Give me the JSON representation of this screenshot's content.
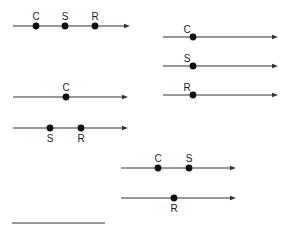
{
  "diagram": {
    "type": "number-line-arrangements",
    "colors": {
      "line": "#333333",
      "dot": "#111111",
      "text": "#1a1a1a",
      "background": "#ffffff"
    },
    "lines": [
      {
        "id": "line-1",
        "x1": 13,
        "x2": 130,
        "y": 26,
        "arrow": true,
        "points": [
          {
            "label": "C",
            "x": 36,
            "label_pos": "above"
          },
          {
            "label": "S",
            "x": 65,
            "label_pos": "above"
          },
          {
            "label": "R",
            "x": 95,
            "label_pos": "above"
          }
        ]
      },
      {
        "id": "line-2",
        "x1": 163,
        "x2": 278,
        "y": 37,
        "arrow": true,
        "points": [
          {
            "label": "C",
            "x": 193,
            "label_pos": "above-left"
          }
        ]
      },
      {
        "id": "line-3",
        "x1": 163,
        "x2": 278,
        "y": 66,
        "arrow": true,
        "points": [
          {
            "label": "S",
            "x": 193,
            "label_pos": "above-left"
          }
        ]
      },
      {
        "id": "line-4",
        "x1": 163,
        "x2": 278,
        "y": 95,
        "arrow": true,
        "points": [
          {
            "label": "R",
            "x": 193,
            "label_pos": "above-left"
          }
        ]
      },
      {
        "id": "line-5",
        "x1": 13,
        "x2": 128,
        "y": 97,
        "arrow": true,
        "points": [
          {
            "label": "C",
            "x": 66,
            "label_pos": "above"
          }
        ]
      },
      {
        "id": "line-6",
        "x1": 13,
        "x2": 128,
        "y": 128,
        "arrow": true,
        "points": [
          {
            "label": "S",
            "x": 50,
            "label_pos": "below"
          },
          {
            "label": "R",
            "x": 81,
            "label_pos": "below"
          }
        ]
      },
      {
        "id": "line-7",
        "x1": 121,
        "x2": 236,
        "y": 168,
        "arrow": true,
        "points": [
          {
            "label": "C",
            "x": 158,
            "label_pos": "above"
          },
          {
            "label": "S",
            "x": 189,
            "label_pos": "above"
          }
        ]
      },
      {
        "id": "line-8",
        "x1": 121,
        "x2": 236,
        "y": 198,
        "arrow": true,
        "points": [
          {
            "label": "R",
            "x": 174,
            "label_pos": "below"
          }
        ]
      },
      {
        "id": "answer-blank",
        "x1": 12,
        "x2": 105,
        "y": 223,
        "arrow": false,
        "points": []
      }
    ]
  }
}
